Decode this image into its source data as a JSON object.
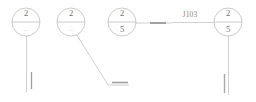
{
  "diagram": {
    "type": "electrical-schematic-fragment",
    "background_color": "#ffffff",
    "line_color": "#b9b9b9",
    "bold_line_color": "#9a9a9a",
    "text_color": "#6f6f6f",
    "faint_text_color": "#cfcfcf",
    "nodes": [
      {
        "id": "node-1",
        "cx": 26,
        "cy": 22,
        "r": 14,
        "top_label": "2",
        "bottom_label": "–",
        "bottom_is_faint": true
      },
      {
        "id": "node-2",
        "cx": 71,
        "cy": 22,
        "r": 14,
        "top_label": "2",
        "bottom_label": "–",
        "bottom_is_faint": true
      },
      {
        "id": "node-3",
        "cx": 122,
        "cy": 22,
        "r": 14,
        "top_label": "2",
        "bottom_label": "5",
        "bottom_is_faint": false
      },
      {
        "id": "node-4",
        "cx": 228,
        "cy": 22,
        "r": 14,
        "top_label": "2",
        "bottom_label": "5",
        "bottom_is_faint": false
      }
    ],
    "wire_labels": [
      {
        "id": "wire-label-j103",
        "text": "J103",
        "x": 190,
        "y": 15
      }
    ],
    "connectors": [
      {
        "id": "lead-node-1-down",
        "kind": "vertical-lead"
      },
      {
        "id": "tick-node-1",
        "kind": "terminal-tick"
      },
      {
        "id": "lead-node-2-diagonal",
        "kind": "diagonal-lead"
      },
      {
        "id": "lead-node-2-horizontal",
        "kind": "horizontal-lead"
      },
      {
        "id": "bar-node-2-end",
        "kind": "terminal-bar"
      },
      {
        "id": "lead-node-3-right",
        "kind": "horizontal-lead"
      },
      {
        "id": "bar-mid-right",
        "kind": "terminal-bar"
      },
      {
        "id": "lead-j103-bus",
        "kind": "horizontal-bus"
      },
      {
        "id": "lead-node-4-down",
        "kind": "vertical-lead"
      },
      {
        "id": "tick-node-4",
        "kind": "terminal-tick"
      }
    ]
  }
}
